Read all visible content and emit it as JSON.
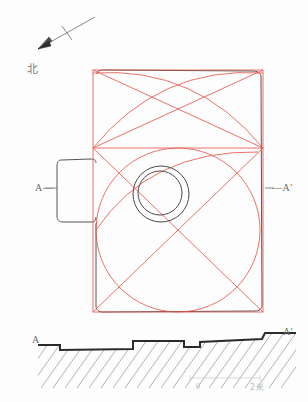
{
  "figure": {
    "type": "archaeological-site-plan",
    "colors": {
      "construction_line": "#e8564a",
      "outline": "#555555",
      "hatch": "#8a8a8a",
      "label_text": "#6b6b6b",
      "background": "#fdfdfd"
    }
  },
  "north_arrow": {
    "label": "北",
    "icon": "north-arrow-icon",
    "tail_x": 95,
    "tail_y": 17,
    "head_x": 33,
    "head_y": 52,
    "tick_x": 68,
    "tick_y": 32
  },
  "plan": {
    "section_marker_left": "A—",
    "section_marker_right": "—A'",
    "outer_rect": {
      "x": 93,
      "y": 70,
      "w": 170,
      "h": 242
    },
    "mid_line_y": 148,
    "center_circles": [
      {
        "cx": 161,
        "cy": 194,
        "r": 28
      },
      {
        "cx": 160,
        "cy": 193,
        "r": 22
      }
    ],
    "main_circle": {
      "cx": 178,
      "cy": 230,
      "r": 82
    },
    "protrusion": {
      "x": 57,
      "y": 160,
      "w": 40,
      "h": 62
    }
  },
  "section": {
    "label_left": "A",
    "label_right": "A'",
    "baseline": [
      {
        "x": 38,
        "y": 345
      },
      {
        "x": 60,
        "y": 345
      },
      {
        "x": 60,
        "y": 350
      },
      {
        "x": 133,
        "y": 349
      },
      {
        "x": 133,
        "y": 341
      },
      {
        "x": 184,
        "y": 341
      },
      {
        "x": 184,
        "y": 347
      },
      {
        "x": 200,
        "y": 347
      },
      {
        "x": 200,
        "y": 342
      },
      {
        "x": 262,
        "y": 339
      },
      {
        "x": 265,
        "y": 333
      },
      {
        "x": 296,
        "y": 333
      }
    ],
    "hatch_depth": 38
  },
  "scale_bar": {
    "zero_label": "0",
    "max_label": "2米",
    "x": 190,
    "y": 378,
    "width": 70
  }
}
